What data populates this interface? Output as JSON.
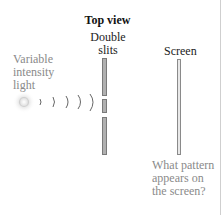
{
  "figure": {
    "title": "Top view",
    "source_label": [
      "Variable",
      "intensity",
      "light"
    ],
    "slits_label": [
      "Double",
      "slits"
    ],
    "screen_label": "Screen",
    "question": [
      "What pattern",
      "appears on",
      "the screen?"
    ]
  },
  "elements": {
    "light_source": "glowing-light-source",
    "wavefronts_count": 5,
    "slit_barrier_segments": 3,
    "screen": "vertical-screen"
  },
  "colors": {
    "title": "#111111",
    "labels_dark": "#222222",
    "labels_gray": "#8a8a8a",
    "barrier_fill": "#b0b0b0",
    "screen_fill": "#e8e8e8"
  }
}
